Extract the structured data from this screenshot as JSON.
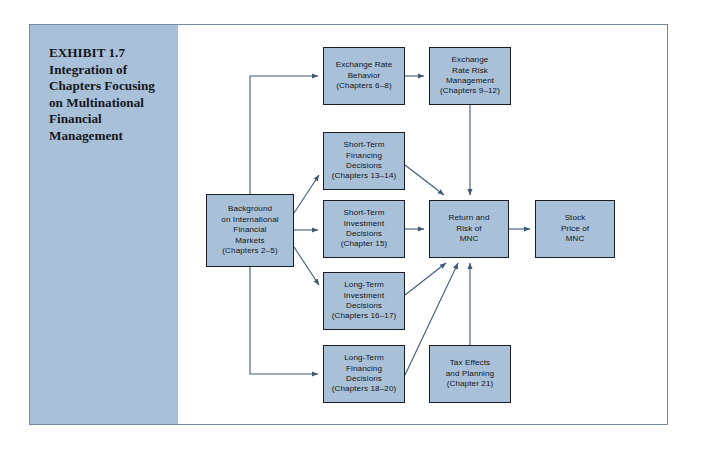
{
  "exhibit": {
    "caption_lines": [
      "EXHIBIT 1.7",
      "Integration of",
      "Chapters Focusing",
      "on Multinational",
      "Financial",
      "Management"
    ],
    "caption_text": "EXHIBIT 1.7 Integration of Chapters Focusing on Multinational Financial Management"
  },
  "colors": {
    "box_fill": "#a8c0d8",
    "box_border": "#1a1d24",
    "sidebar_fill": "#a8c0d8",
    "frame_border": "#6f8aa6",
    "connector": "#3c5a78",
    "page_background": "#ffffff"
  },
  "chart_data": {
    "type": "diagram",
    "nodes": [
      {
        "id": "background",
        "lines": [
          "Background",
          "on International",
          "Financial",
          "Markets",
          "(Chapters 2–5)"
        ],
        "x": 176,
        "y": 169,
        "w": 88,
        "h": 73
      },
      {
        "id": "exchange-rate-behavior",
        "lines": [
          "Exchange Rate",
          "Behavior",
          "(Chapters 6–8)"
        ],
        "x": 293,
        "y": 22,
        "w": 82,
        "h": 58
      },
      {
        "id": "exchange-rate-risk-management",
        "lines": [
          "Exchange",
          "Rate Risk",
          "Management",
          "(Chapters 9–12)"
        ],
        "x": 399,
        "y": 22,
        "w": 82,
        "h": 58
      },
      {
        "id": "short-term-financing",
        "lines": [
          "Short-Term",
          "Financing",
          "Decisions",
          "(Chapters 13–14)"
        ],
        "x": 293,
        "y": 107,
        "w": 82,
        "h": 58
      },
      {
        "id": "short-term-investment",
        "lines": [
          "Short-Term",
          "Investment",
          "Decisions",
          "(Chapter 15)"
        ],
        "x": 293,
        "y": 175,
        "w": 82,
        "h": 58
      },
      {
        "id": "long-term-investment",
        "lines": [
          "Long-Term",
          "Investment",
          "Decisions",
          "(Chapters 16–17)"
        ],
        "x": 293,
        "y": 247,
        "w": 82,
        "h": 58
      },
      {
        "id": "long-term-financing",
        "lines": [
          "Long-Term",
          "Financing",
          "Decisions",
          "(Chapters 18–20)"
        ],
        "x": 293,
        "y": 320,
        "w": 82,
        "h": 58
      },
      {
        "id": "tax-effects",
        "lines": [
          "Tax Effects",
          "and Planning",
          "(Chapter 21)"
        ],
        "x": 399,
        "y": 320,
        "w": 82,
        "h": 58
      },
      {
        "id": "return-risk-mnc",
        "lines": [
          "Return and",
          "Risk of",
          "MNC"
        ],
        "x": 399,
        "y": 175,
        "w": 80,
        "h": 58
      },
      {
        "id": "stock-price-mnc",
        "lines": [
          "Stock",
          "Price of",
          "MNC"
        ],
        "x": 505,
        "y": 175,
        "w": 80,
        "h": 58
      }
    ],
    "edges": [
      {
        "from": "background",
        "to": "exchange-rate-behavior",
        "style": "elbow-up-left"
      },
      {
        "from": "exchange-rate-behavior",
        "to": "exchange-rate-risk-management",
        "style": "straight-right"
      },
      {
        "from": "exchange-rate-risk-management",
        "to": "return-risk-mnc",
        "style": "straight-down"
      },
      {
        "from": "background",
        "to": "short-term-financing",
        "style": "diagonal-up-right"
      },
      {
        "from": "background",
        "to": "short-term-investment",
        "style": "straight-right"
      },
      {
        "from": "background",
        "to": "long-term-investment",
        "style": "diagonal-down-right"
      },
      {
        "from": "background",
        "to": "long-term-financing",
        "style": "elbow-down-left"
      },
      {
        "from": "short-term-financing",
        "to": "return-risk-mnc",
        "style": "diagonal-down-right"
      },
      {
        "from": "short-term-investment",
        "to": "return-risk-mnc",
        "style": "straight-right"
      },
      {
        "from": "long-term-investment",
        "to": "return-risk-mnc",
        "style": "diagonal-up-right"
      },
      {
        "from": "long-term-financing",
        "to": "return-risk-mnc",
        "style": "diagonal-up-right"
      },
      {
        "from": "tax-effects",
        "to": "return-risk-mnc",
        "style": "straight-up"
      },
      {
        "from": "return-risk-mnc",
        "to": "stock-price-mnc",
        "style": "straight-right"
      }
    ]
  }
}
